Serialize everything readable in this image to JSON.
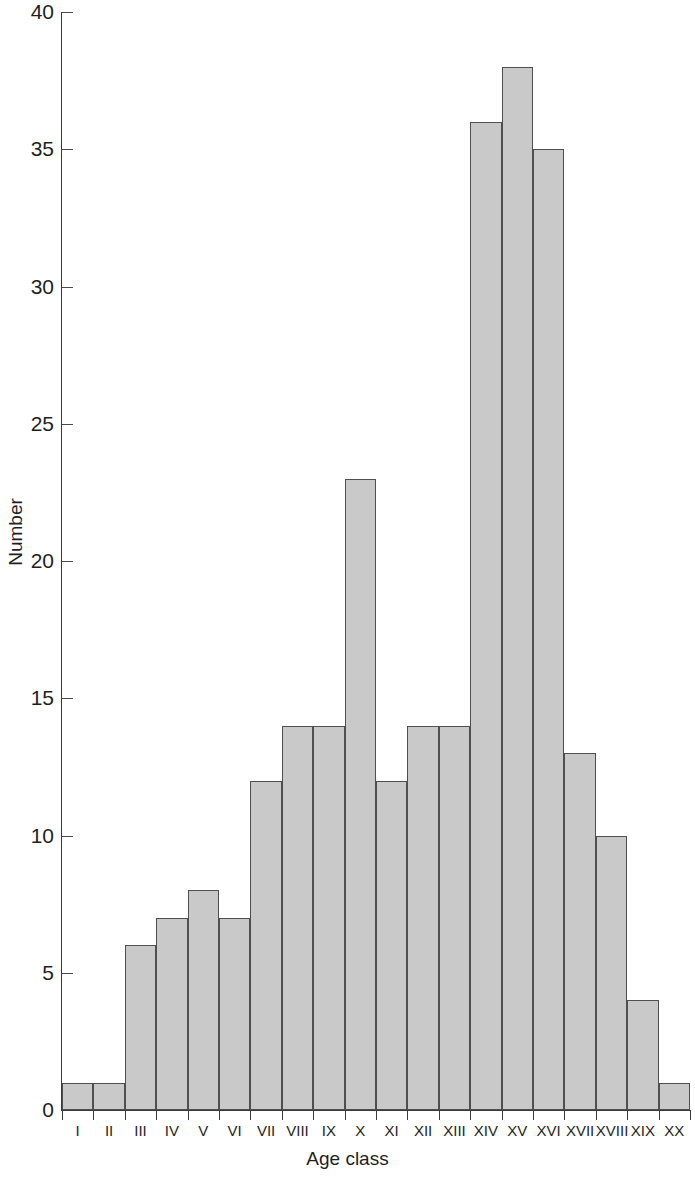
{
  "chart_data": {
    "type": "bar",
    "title": "",
    "xlabel": "Age class",
    "ylabel": "Number",
    "categories": [
      "I",
      "II",
      "III",
      "IV",
      "V",
      "VI",
      "VII",
      "VIII",
      "IX",
      "X",
      "XI",
      "XII",
      "XIII",
      "XIV",
      "XV",
      "XVI",
      "XVII",
      "XVIII",
      "XIX",
      "XX"
    ],
    "values": [
      1,
      1,
      6,
      7,
      8,
      7,
      12,
      14,
      14,
      23,
      12,
      14,
      14,
      36,
      38,
      35,
      13,
      10,
      4,
      1
    ],
    "ylim": [
      0,
      40
    ],
    "y_ticks": [
      0,
      5,
      10,
      15,
      20,
      25,
      30,
      35,
      40
    ],
    "y_tick_labels": [
      "0",
      "5",
      "10",
      "15",
      "20",
      "25",
      "30",
      "35",
      "40"
    ],
    "grid": false,
    "legend": null,
    "bar_fill_color": "#c9c9c9",
    "bar_edge_color": "#4f4f4f",
    "axis_color": "#3a3a3a",
    "background_color": "#ffffff"
  }
}
